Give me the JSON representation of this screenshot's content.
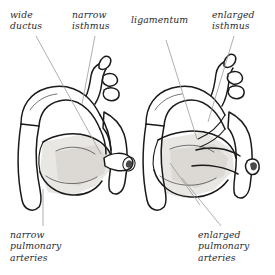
{
  "figure": {
    "caption_type": "anatomical-illustration",
    "background_color": "#ffffff",
    "ink_color": "#1a1a1a",
    "leader_color": "#9a9a9a",
    "shading_color": "#e8e6e3"
  },
  "labels": {
    "wide_ductus": "wide\nductus",
    "narrow_isthmus": "narrow\nisthmus",
    "ligamentum": "ligamentum",
    "enlarged_isthmus": "enlarged\nisthmus",
    "narrow_pulmonary_arteries": "narrow\npulmonary\narteries",
    "enlarged_pulmonary_arteries": "enlarged\npulmonary\narteries"
  },
  "diagrams": [
    {
      "id": "left-aortic-arch",
      "name": "left-figure",
      "description": "aortic arch with wide ductus, narrow isthmus and narrow pulmonary arteries"
    },
    {
      "id": "right-aortic-arch",
      "name": "right-figure",
      "description": "aortic arch with ligamentum, enlarged isthmus and enlarged pulmonary arteries"
    }
  ],
  "leader_lines": [
    {
      "name": "leader-wide-ductus",
      "x1": 36,
      "y1": 36,
      "x2": 101,
      "y2": 154
    },
    {
      "name": "leader-narrow-isthmus",
      "x1": 95,
      "y1": 36,
      "x2": 82,
      "y2": 104
    },
    {
      "name": "leader-ligamentum",
      "x1": 166,
      "y1": 40,
      "x2": 197,
      "y2": 139
    },
    {
      "name": "leader-enlarged-isthmus",
      "x1": 234,
      "y1": 36,
      "x2": 208,
      "y2": 122
    },
    {
      "name": "leader-narrow-pulmonary",
      "x1": 43,
      "y1": 226,
      "x2": 43,
      "y2": 189
    },
    {
      "name": "leader-enlarged-pulmonary",
      "x1": 221,
      "y1": 226,
      "x2": 182,
      "y2": 178
    },
    {
      "name": "leader-enlarged-pulmonary-branch",
      "x1": 200,
      "y1": 205,
      "x2": 170,
      "y2": 163
    }
  ]
}
